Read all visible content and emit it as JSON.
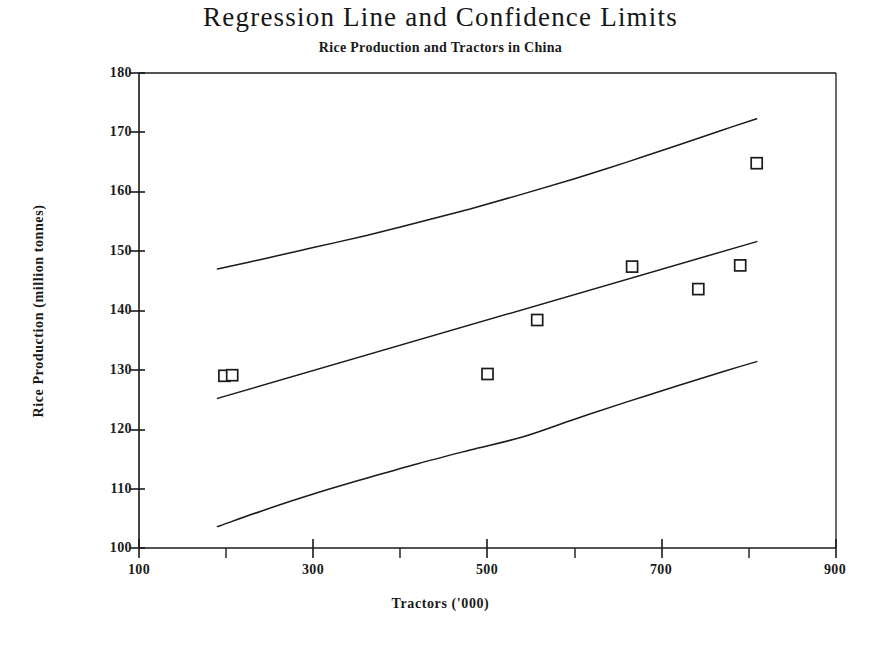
{
  "chart_data": {
    "type": "scatter",
    "title": "Regression Line and Confidence Limits",
    "subtitle": "Rice Production and Tractors in China",
    "xlabel": "Tractors ('000)",
    "ylabel": "Rice Production (million tonnes)",
    "xlim": [
      100,
      900
    ],
    "ylim": [
      100,
      180
    ],
    "grid": false,
    "legend": null,
    "xticks_major": [
      "100",
      "300",
      "500",
      "700",
      "900"
    ],
    "xticks_major_values": [
      100,
      300,
      500,
      700,
      900
    ],
    "xticks_minor_values": [
      200,
      400,
      600,
      800
    ],
    "yticks": [
      "100",
      "110",
      "120",
      "130",
      "140",
      "150",
      "160",
      "170",
      "180"
    ],
    "yticks_values": [
      100,
      110,
      120,
      130,
      140,
      150,
      160,
      170,
      180
    ],
    "marker": "open-square",
    "points": [
      {
        "x": 198,
        "y": 129.0
      },
      {
        "x": 207,
        "y": 129.1
      },
      {
        "x": 500,
        "y": 129.3
      },
      {
        "x": 557,
        "y": 138.4
      },
      {
        "x": 666,
        "y": 147.4
      },
      {
        "x": 742,
        "y": 143.6
      },
      {
        "x": 790,
        "y": 147.6
      },
      {
        "x": 809,
        "y": 164.8
      }
    ],
    "series": [
      {
        "name": "Upper confidence limit",
        "type": "line",
        "x": [
          190,
          240,
          300,
          360,
          420,
          480,
          540,
          600,
          660,
          720,
          770,
          809
        ],
        "values": [
          147.0,
          148.6,
          150.6,
          152.6,
          154.8,
          157.1,
          159.6,
          162.2,
          165.0,
          167.9,
          170.4,
          172.3
        ]
      },
      {
        "name": "Regression line",
        "type": "line",
        "x": [
          190,
          809
        ],
        "values": [
          125.2,
          151.6
        ]
      },
      {
        "name": "Lower confidence limit",
        "type": "line",
        "x": [
          190,
          240,
          300,
          360,
          420,
          480,
          540,
          600,
          660,
          720,
          770,
          809
        ],
        "values": [
          103.6,
          106.2,
          109.1,
          111.7,
          114.2,
          116.5,
          118.7,
          121.7,
          124.6,
          127.4,
          129.7,
          131.4
        ]
      }
    ],
    "colors": {
      "line": "#1a1a1a",
      "marker_stroke": "#1a1a1a",
      "marker_fill": "#ffffff",
      "axis": "#1a1a1a",
      "background": "#ffffff"
    }
  }
}
